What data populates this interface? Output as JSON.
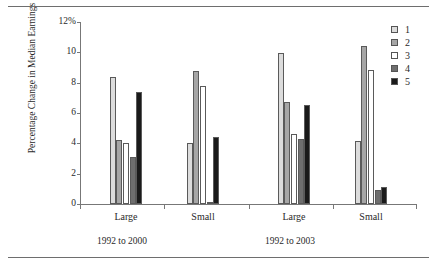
{
  "chart_data": {
    "type": "bar",
    "title": "",
    "xlabel": "",
    "ylabel": "Percentage Change in Median Earnings",
    "ylim": [
      0,
      12
    ],
    "ytick_labels": [
      "12%",
      "10",
      "8",
      "6",
      "4",
      "2",
      "0"
    ],
    "ytick_values": [
      12,
      10,
      8,
      6,
      4,
      2,
      0
    ],
    "grid": false,
    "legend_position": "right",
    "categories": [
      "Large",
      "Small",
      "Large",
      "Small"
    ],
    "panels": [
      {
        "label": "1992 to 2000",
        "categories": [
          "Large",
          "Small"
        ]
      },
      {
        "label": "1992 to 2003",
        "categories": [
          "Large",
          "Small"
        ]
      }
    ],
    "series": [
      {
        "name": "1",
        "color": "#dcdcdc",
        "values": [
          8.4,
          4.0,
          9.95,
          4.15
        ]
      },
      {
        "name": "2",
        "color": "#a6a6a6",
        "values": [
          4.2,
          8.8,
          6.75,
          10.4
        ]
      },
      {
        "name": "3",
        "color": "#ffffff",
        "values": [
          4.0,
          7.8,
          4.6,
          8.85
        ]
      },
      {
        "name": "4",
        "color": "#6e6e6e",
        "values": [
          3.1,
          0.1,
          4.3,
          0.9
        ]
      },
      {
        "name": "5",
        "color": "#1a1a1a",
        "values": [
          7.4,
          4.4,
          6.55,
          1.15
        ]
      }
    ]
  },
  "legend": {
    "items": [
      {
        "label": "1"
      },
      {
        "label": "2"
      },
      {
        "label": "3"
      },
      {
        "label": "4"
      },
      {
        "label": "5"
      }
    ]
  },
  "axes": {
    "y_title": "Percentage Change in Median Earnings"
  }
}
